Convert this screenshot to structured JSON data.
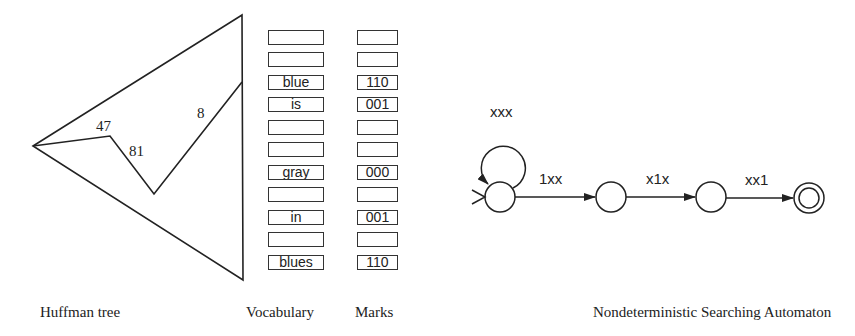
{
  "huffman_tree": {
    "caption": "Huffman tree",
    "labels": [
      "47",
      "81",
      "8"
    ]
  },
  "vocabulary": {
    "caption": "Vocabulary",
    "rows": [
      "",
      "",
      "blue",
      "is",
      "",
      "",
      "gray",
      "",
      "in",
      "",
      "blues"
    ]
  },
  "marks": {
    "caption": "Marks",
    "rows": [
      "",
      "",
      "110",
      "001",
      "",
      "",
      "000",
      "",
      "001",
      "",
      "110"
    ]
  },
  "automaton": {
    "caption": "Nondeterministic Searching Automaton",
    "self_loop_label": "xxx",
    "transitions": [
      "1xx",
      "x1x",
      "xx1"
    ]
  }
}
